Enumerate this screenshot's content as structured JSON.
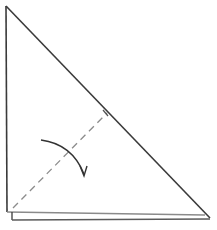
{
  "diagram": {
    "type": "origami-fold-step",
    "shape": "right-triangle",
    "colors": {
      "outline": "#3a3a3a",
      "inner_edge": "#8a8a8a",
      "dashed_fold": "#8c8c8c",
      "arrow": "#333333",
      "background": "#ffffff"
    },
    "vertices": {
      "top": [
        6,
        6
      ],
      "bottom_left": [
        7,
        212
      ],
      "bottom_right": [
        210,
        218
      ]
    },
    "fold_line": {
      "style": "valley (dashed)",
      "from": [
        12,
        208
      ],
      "to": [
        107,
        113
      ]
    },
    "fold_arrow": {
      "direction": "down",
      "description": "curved arrow indicating fold of the left section downward"
    }
  }
}
